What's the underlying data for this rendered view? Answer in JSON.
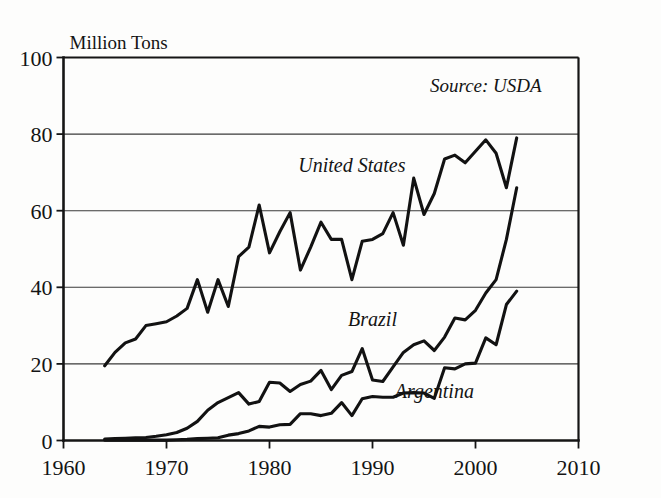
{
  "chart_data": {
    "type": "line",
    "title": "",
    "ylabel": "Million Tons",
    "xlabel": "",
    "xlim": [
      1960,
      2010
    ],
    "ylim": [
      0,
      100
    ],
    "grid": true,
    "xticks": [
      1960,
      1970,
      1980,
      1990,
      2000,
      2010
    ],
    "yticks": [
      0,
      20,
      40,
      60,
      80,
      100
    ],
    "annotations": [
      {
        "name": "source-note",
        "text": "Source: USDA",
        "x": 2001,
        "y": 91
      }
    ],
    "legend_position": "inline-labels",
    "series": [
      {
        "name": "United States",
        "label": "United States",
        "label_x": 1988,
        "label_y": 70,
        "x": [
          1964,
          1965,
          1966,
          1967,
          1968,
          1969,
          1970,
          1971,
          1972,
          1973,
          1974,
          1975,
          1976,
          1977,
          1978,
          1979,
          1980,
          1981,
          1982,
          1983,
          1984,
          1985,
          1986,
          1987,
          1988,
          1989,
          1990,
          1991,
          1992,
          1993,
          1994,
          1995,
          1996,
          1997,
          1998,
          1999,
          2000,
          2001,
          2002,
          2003,
          2004
        ],
        "values": [
          19.5,
          23.0,
          25.5,
          26.5,
          30.0,
          30.5,
          31.0,
          32.5,
          34.5,
          42.0,
          33.5,
          42.0,
          35.0,
          48.0,
          50.5,
          61.5,
          49.0,
          54.5,
          59.5,
          44.5,
          50.5,
          57.0,
          52.5,
          52.5,
          42.0,
          52.0,
          52.5,
          54.0,
          59.5,
          51.0,
          68.5,
          59.0,
          64.5,
          73.5,
          74.5,
          72.5,
          75.5,
          78.5,
          75.0,
          66.0,
          79.0
        ]
      },
      {
        "name": "Brazil",
        "label": "Brazil",
        "label_x": 1990,
        "label_y": 30,
        "x": [
          1964,
          1965,
          1966,
          1967,
          1968,
          1969,
          1970,
          1971,
          1972,
          1973,
          1974,
          1975,
          1976,
          1977,
          1978,
          1979,
          1980,
          1981,
          1982,
          1983,
          1984,
          1985,
          1986,
          1987,
          1988,
          1989,
          1990,
          1991,
          1992,
          1993,
          1994,
          1995,
          1996,
          1997,
          1998,
          1999,
          2000,
          2001,
          2002,
          2003,
          2004
        ],
        "values": [
          0.4,
          0.5,
          0.6,
          0.7,
          0.8,
          1.1,
          1.5,
          2.1,
          3.2,
          5.0,
          7.9,
          9.9,
          11.2,
          12.5,
          9.5,
          10.2,
          15.2,
          15.0,
          12.8,
          14.6,
          15.5,
          18.3,
          13.3,
          17.0,
          18.0,
          24.0,
          15.8,
          15.4,
          19.2,
          23.0,
          25.0,
          26.0,
          23.5,
          27.0,
          32.0,
          31.5,
          34.0,
          38.5,
          42.0,
          52.5,
          66.0
        ]
      },
      {
        "name": "Argentina",
        "label": "Argentina",
        "label_x": 1996,
        "label_y": 11,
        "x": [
          1964,
          1965,
          1966,
          1967,
          1968,
          1969,
          1970,
          1971,
          1972,
          1973,
          1974,
          1975,
          1976,
          1977,
          1978,
          1979,
          1980,
          1981,
          1982,
          1983,
          1984,
          1985,
          1986,
          1987,
          1988,
          1989,
          1990,
          1991,
          1992,
          1993,
          1994,
          1995,
          1996,
          1997,
          1998,
          1999,
          2000,
          2001,
          2002,
          2003,
          2004
        ],
        "values": [
          0.1,
          0.1,
          0.1,
          0.1,
          0.1,
          0.1,
          0.1,
          0.2,
          0.3,
          0.5,
          0.6,
          0.7,
          1.4,
          1.8,
          2.5,
          3.7,
          3.5,
          4.1,
          4.2,
          7.0,
          7.0,
          6.5,
          7.1,
          9.9,
          6.5,
          10.9,
          11.5,
          11.3,
          11.3,
          12.4,
          12.5,
          12.4,
          11.0,
          19.0,
          18.7,
          20.0,
          20.2,
          26.8,
          25.0,
          35.5,
          39.0
        ]
      }
    ]
  }
}
